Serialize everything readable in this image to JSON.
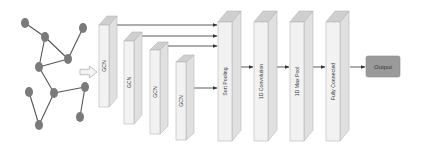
{
  "diagram": {
    "type": "neural-network-architecture",
    "colors": {
      "node_fill": "#7a7a7a",
      "edge": "#555555",
      "block_front": "#f2f2f2",
      "block_side": "#e0e0e0",
      "block_top": "#cfcfcf",
      "block_stroke": "#b5b5b5",
      "arrow": "#333333",
      "output_fill": "#9a9a9a",
      "output_stroke": "#8a8a8a",
      "input_arrow_fill": "#f4f4f4",
      "input_arrow_stroke": "#b0b0b0"
    },
    "input_graph": {
      "nodes": [
        {
          "id": "a",
          "x": 25,
          "y": 23
        },
        {
          "id": "b",
          "x": 45,
          "y": 37
        },
        {
          "id": "c",
          "x": 83,
          "y": 28
        },
        {
          "id": "d",
          "x": 68,
          "y": 59
        },
        {
          "id": "e",
          "x": 39,
          "y": 67
        },
        {
          "id": "f",
          "x": 29,
          "y": 92
        },
        {
          "id": "g",
          "x": 54,
          "y": 93
        },
        {
          "id": "h",
          "x": 85,
          "y": 87
        },
        {
          "id": "i",
          "x": 80,
          "y": 117
        },
        {
          "id": "j",
          "x": 39,
          "y": 125
        }
      ],
      "edges": [
        [
          "a",
          "b"
        ],
        [
          "b",
          "d"
        ],
        [
          "b",
          "e"
        ],
        [
          "c",
          "d"
        ],
        [
          "d",
          "e"
        ],
        [
          "e",
          "g"
        ],
        [
          "g",
          "h"
        ],
        [
          "g",
          "j"
        ],
        [
          "f",
          "j"
        ],
        [
          "h",
          "i"
        ]
      ]
    },
    "blocks": [
      {
        "id": "gcn1",
        "label": "GCN",
        "x": 99,
        "top": 25,
        "bottom": 107,
        "w": 10,
        "dx": 8,
        "dy": 9
      },
      {
        "id": "gcn2",
        "label": "GCN",
        "x": 124,
        "top": 41,
        "bottom": 124,
        "w": 10,
        "dx": 8,
        "dy": 9
      },
      {
        "id": "gcn3",
        "label": "GCN",
        "x": 150,
        "top": 50,
        "bottom": 134,
        "w": 10,
        "dx": 8,
        "dy": 8
      },
      {
        "id": "gcn4",
        "label": "GCN",
        "x": 176,
        "top": 62,
        "bottom": 140,
        "w": 10,
        "dx": 8,
        "dy": 7
      },
      {
        "id": "sort-pooling",
        "label": "Sort Pooling",
        "x": 218,
        "top": 22,
        "bottom": 141,
        "w": 14,
        "dx": 9,
        "dy": 11
      },
      {
        "id": "conv1d",
        "label": "1D Convolution",
        "x": 254,
        "top": 22,
        "bottom": 141,
        "w": 14,
        "dx": 9,
        "dy": 11
      },
      {
        "id": "maxpool1d",
        "label": "1D Max Pool",
        "x": 290,
        "top": 22,
        "bottom": 141,
        "w": 14,
        "dx": 9,
        "dy": 11
      },
      {
        "id": "fully-connected",
        "label": "Fully Connected",
        "x": 326,
        "top": 22,
        "bottom": 141,
        "w": 14,
        "dx": 9,
        "dy": 11
      }
    ],
    "skip_arrows": [
      {
        "from": "gcn1",
        "x1": 117,
        "x2": 217,
        "y": 25
      },
      {
        "from": "gcn2",
        "x1": 142,
        "x2": 217,
        "y": 36
      },
      {
        "from": "gcn3",
        "x1": 168,
        "x2": 217,
        "y": 46
      },
      {
        "from": "gcn4",
        "x1": 194,
        "x2": 217,
        "y": 88
      }
    ],
    "flow_arrows": [
      {
        "from": "sort-pooling",
        "to": "conv1d",
        "x1": 241,
        "x2": 253,
        "y": 67
      },
      {
        "from": "conv1d",
        "to": "maxpool1d",
        "x1": 277,
        "x2": 289,
        "y": 67
      },
      {
        "from": "maxpool1d",
        "to": "fully-connected",
        "x1": 313,
        "x2": 325,
        "y": 67
      },
      {
        "from": "fully-connected",
        "to": "output",
        "x1": 350,
        "x2": 365,
        "y": 67
      }
    ],
    "input_arrow": {
      "x": 80,
      "y": 66,
      "w": 17,
      "h": 12
    },
    "output": {
      "label": "Output",
      "x": 366,
      "y": 56,
      "w": 34,
      "h": 21
    }
  }
}
